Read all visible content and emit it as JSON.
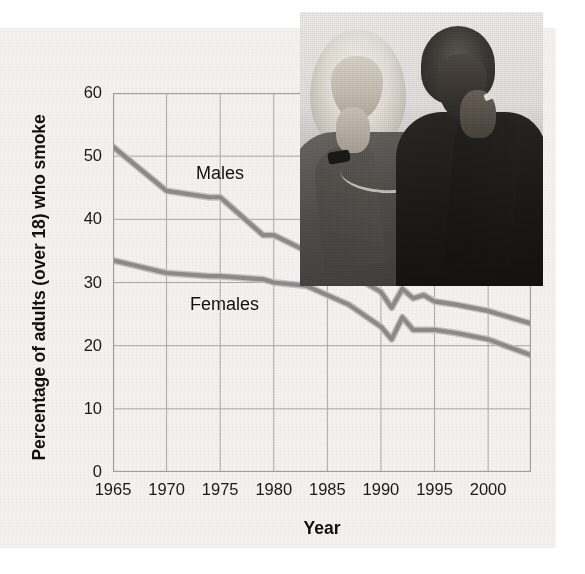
{
  "chart_data": {
    "type": "line",
    "title": "",
    "xlabel": "Year",
    "ylabel": "Percentage of adults (over 18) who smoke",
    "xlim": [
      1965,
      2004
    ],
    "ylim": [
      0,
      60
    ],
    "xticks": [
      "1965",
      "1970",
      "1975",
      "1980",
      "1985",
      "1990",
      "1995",
      "2000"
    ],
    "xtick_values": [
      1965,
      1970,
      1975,
      1980,
      1985,
      1990,
      1995,
      2000
    ],
    "yticks": [
      "0",
      "10",
      "20",
      "30",
      "40",
      "50",
      "60"
    ],
    "ytick_values": [
      0,
      10,
      20,
      30,
      40,
      50,
      60
    ],
    "grid": true,
    "legend_position": "inline-annotations",
    "series": [
      {
        "name": "Males",
        "label": "Males",
        "color": "#8a8a8a",
        "x": [
          1965,
          1970,
          1974,
          1975,
          1979,
          1980,
          1983,
          1985,
          1987,
          1990,
          1991,
          1992,
          1993,
          1994,
          1995,
          1997,
          2000,
          2004
        ],
        "values": [
          51.5,
          44.5,
          43.5,
          43.5,
          37.5,
          37.5,
          35.0,
          33.0,
          31.5,
          28.5,
          26.0,
          29.0,
          27.5,
          28.0,
          27.0,
          26.5,
          25.5,
          23.5
        ]
      },
      {
        "name": "Females",
        "label": "Females",
        "color": "#8a8a8a",
        "x": [
          1965,
          1970,
          1974,
          1975,
          1979,
          1980,
          1983,
          1985,
          1987,
          1990,
          1991,
          1992,
          1993,
          1994,
          1995,
          1997,
          2000,
          2004
        ],
        "values": [
          33.5,
          31.5,
          31.0,
          31.0,
          30.5,
          30.0,
          29.5,
          28.0,
          26.5,
          23.0,
          21.0,
          24.5,
          22.5,
          22.5,
          22.5,
          22.0,
          21.0,
          18.5
        ]
      }
    ]
  },
  "labels": {
    "males": "Males",
    "females": "Females",
    "x_axis_title": "Year",
    "y_axis_title": "Percentage of adults (over 18) who smoke"
  },
  "credit": {
    "text": "© Spencer Grant/PhotoEdit"
  },
  "photo": {
    "alt": "Two women smoking cigarettes"
  }
}
